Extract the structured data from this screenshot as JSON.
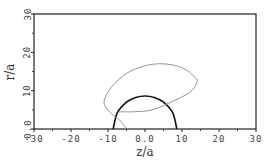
{
  "chart_data": {
    "type": "line",
    "title": "",
    "xlabel": "z/a",
    "ylabel": "r/a",
    "xlim": [
      -30,
      30
    ],
    "ylim": [
      0,
      30
    ],
    "grid": false,
    "legend": null,
    "xticks": [
      -30,
      -20,
      -10,
      0,
      10,
      20,
      30
    ],
    "xtick_labels": [
      "-30",
      "-20",
      "-10",
      "0.0",
      "10",
      "20",
      "30"
    ],
    "yticks": [
      0,
      10,
      20,
      30
    ],
    "ytick_labels": [
      "0.0",
      "10",
      "20",
      "30"
    ],
    "series": [
      {
        "name": "thick semicircle",
        "style": "thick black",
        "points": [
          [
            -8.6,
            0
          ],
          [
            -7.5,
            4.2
          ],
          [
            -5,
            7.0
          ],
          [
            -2.5,
            8.2
          ],
          [
            0,
            8.6
          ],
          [
            2.5,
            8.2
          ],
          [
            5,
            7.0
          ],
          [
            7.5,
            4.2
          ],
          [
            8.6,
            0
          ]
        ]
      },
      {
        "name": "thin loop",
        "style": "thin gray",
        "points": [
          [
            -5,
            0
          ],
          [
            -6.5,
            2.0
          ],
          [
            -8.5,
            3.5
          ],
          [
            -10.5,
            5.5
          ],
          [
            -11,
            7.5
          ],
          [
            -9,
            11
          ],
          [
            -5,
            14.5
          ],
          [
            0,
            16.5
          ],
          [
            5,
            17
          ],
          [
            10,
            16
          ],
          [
            13.5,
            13.5
          ],
          [
            14,
            12
          ],
          [
            12,
            9.5
          ],
          [
            7,
            7
          ],
          [
            2,
            5
          ],
          [
            -3,
            4.5
          ],
          [
            -7,
            4.5
          ]
        ]
      }
    ]
  }
}
